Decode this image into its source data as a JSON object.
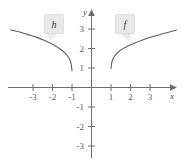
{
  "figure": {
    "width": 182,
    "height": 166,
    "background": "#ffffff",
    "line_color": "#5f5f5f",
    "axis_color": "#6e6e6e",
    "callout_fill": "#e9e9e9"
  },
  "axes": {
    "x_label": "x",
    "y_label": "y",
    "x_ticks": [
      "-3",
      "-2",
      "-1",
      "1",
      "2",
      "3"
    ],
    "y_ticks": [
      "3",
      "2",
      "1",
      "-1",
      "-2",
      "-3"
    ]
  },
  "labels": {
    "left_curve": "h",
    "right_curve": "f"
  },
  "chart_data": {
    "type": "line",
    "title": "",
    "xlabel": "x",
    "ylabel": "y",
    "xlim": [
      -4.2,
      4.4
    ],
    "ylim": [
      -3.6,
      3.6
    ],
    "grid": false,
    "legend": "callout-labels",
    "x_ticks": [
      -3,
      -2,
      -1,
      1,
      2,
      3
    ],
    "y_ticks": [
      3,
      2,
      1,
      -1,
      -2,
      -3
    ],
    "series": [
      {
        "name": "h",
        "label_position": [
          -2.1,
          3.5
        ],
        "domain": [
          -4.15,
          -1.0
        ],
        "points": [
          [
            -4.15,
            2.95
          ],
          [
            -4.0,
            2.92
          ],
          [
            -3.6,
            2.82
          ],
          [
            -3.2,
            2.7
          ],
          [
            -2.8,
            2.57
          ],
          [
            -2.4,
            2.41
          ],
          [
            -2.0,
            2.22
          ],
          [
            -1.7,
            2.04
          ],
          [
            -1.5,
            1.9
          ],
          [
            -1.35,
            1.76
          ],
          [
            -1.2,
            1.58
          ],
          [
            -1.1,
            1.4
          ],
          [
            -1.05,
            1.22
          ],
          [
            -1.02,
            1.05
          ],
          [
            -1.0,
            0.86
          ]
        ]
      },
      {
        "name": "f",
        "label_position": [
          2.1,
          3.5
        ],
        "domain": [
          1.0,
          4.35
        ],
        "points": [
          [
            1.0,
            0.97
          ],
          [
            1.02,
            1.15
          ],
          [
            1.05,
            1.32
          ],
          [
            1.12,
            1.5
          ],
          [
            1.22,
            1.66
          ],
          [
            1.38,
            1.82
          ],
          [
            1.6,
            1.98
          ],
          [
            1.9,
            2.14
          ],
          [
            2.25,
            2.3
          ],
          [
            2.65,
            2.45
          ],
          [
            3.1,
            2.6
          ],
          [
            3.6,
            2.74
          ],
          [
            4.0,
            2.85
          ],
          [
            4.35,
            2.94
          ]
        ]
      }
    ]
  }
}
